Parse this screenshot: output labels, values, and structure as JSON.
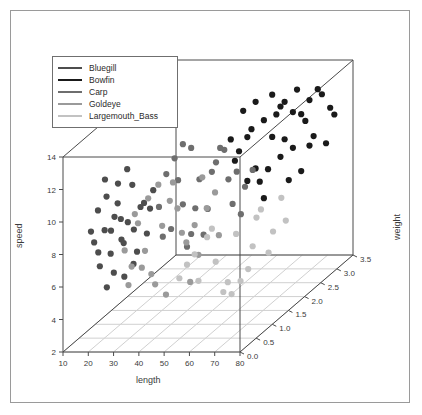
{
  "figure": {
    "background": "#ffffff",
    "border_color": "#9a9a9a"
  },
  "legend": {
    "border_color": "#6f6f6f",
    "entries": [
      {
        "label": "Bluegill",
        "color": "#4d4d4d"
      },
      {
        "label": "Bowfin",
        "color": "#1a1a1a"
      },
      {
        "label": "Carp",
        "color": "#6e6e6e"
      },
      {
        "label": "Goldeye",
        "color": "#9a9a9a"
      },
      {
        "label": "Largemouth_Bass",
        "color": "#c2c2c2"
      }
    ]
  },
  "chart_data": {
    "type": "scatter",
    "projection": "3d",
    "title": "",
    "xlabel": "length",
    "ylabel": "speed",
    "zlabel": "weight",
    "xlim": [
      10,
      80
    ],
    "ylim": [
      2,
      14
    ],
    "zlim": [
      0.0,
      3.5
    ],
    "xticks": [
      10,
      20,
      30,
      40,
      50,
      60,
      70,
      80
    ],
    "yticks": [
      2,
      4,
      6,
      8,
      10,
      12,
      14
    ],
    "zticks": [
      "0.0",
      "0.5",
      "1.0",
      "1.5",
      "2.0",
      "2.5",
      "3.0",
      "3.5"
    ],
    "grid": "floor-only",
    "legend_position": "upper-left",
    "series": [
      {
        "name": "Bluegill",
        "color": "#4d4d4d",
        "points": [
          [
            22,
            8.9,
            0.35
          ],
          [
            25,
            9.6,
            0.42
          ],
          [
            20,
            10.2,
            0.3
          ],
          [
            27,
            8.1,
            0.48
          ],
          [
            24,
            7.4,
            0.38
          ],
          [
            29,
            9.1,
            0.52
          ],
          [
            23,
            11.0,
            0.33
          ],
          [
            31,
            8.6,
            0.55
          ],
          [
            26,
            10.4,
            0.44
          ],
          [
            21,
            6.8,
            0.28
          ],
          [
            33,
            9.9,
            0.6
          ],
          [
            28,
            7.9,
            0.47
          ],
          [
            19,
            8.3,
            0.26
          ],
          [
            30,
            11.3,
            0.58
          ],
          [
            25,
            6.2,
            0.4
          ],
          [
            34,
            10.1,
            0.63
          ],
          [
            22,
            12.0,
            0.36
          ],
          [
            27,
            9.4,
            0.46
          ],
          [
            32,
            7.2,
            0.57
          ],
          [
            24,
            8.8,
            0.39
          ],
          [
            36,
            9.7,
            0.66
          ],
          [
            20,
            7.6,
            0.31
          ],
          [
            29,
            12.4,
            0.5
          ],
          [
            23,
            5.4,
            0.34
          ],
          [
            35,
            8.2,
            0.64
          ],
          [
            26,
            11.6,
            0.45
          ],
          [
            31,
            6.5,
            0.54
          ],
          [
            18,
            9.0,
            0.24
          ],
          [
            37,
            10.8,
            0.68
          ],
          [
            28,
            5.8,
            0.49
          ]
        ]
      },
      {
        "name": "Bowfin",
        "color": "#1a1a1a",
        "points": [
          [
            58,
            11.9,
            1.95
          ],
          [
            62,
            12.6,
            2.15
          ],
          [
            55,
            10.7,
            1.8
          ],
          [
            66,
            13.1,
            2.35
          ],
          [
            60,
            9.8,
            2.05
          ],
          [
            71,
            12.2,
            2.6
          ],
          [
            64,
            11.4,
            2.25
          ],
          [
            57,
            13.6,
            1.9
          ],
          [
            69,
            10.3,
            2.5
          ],
          [
            73,
            12.9,
            2.7
          ],
          [
            61,
            8.9,
            2.1
          ],
          [
            75,
            13.4,
            2.8
          ],
          [
            67,
            11.0,
            2.4
          ],
          [
            59,
            12.3,
            2.0
          ],
          [
            78,
            12.0,
            2.95
          ],
          [
            63,
            9.5,
            2.2
          ],
          [
            70,
            13.8,
            2.55
          ],
          [
            56,
            11.2,
            1.85
          ],
          [
            74,
            10.6,
            2.75
          ],
          [
            65,
            12.7,
            2.3
          ],
          [
            68,
            8.4,
            2.45
          ],
          [
            72,
            11.7,
            2.65
          ],
          [
            54,
            12.1,
            1.75
          ],
          [
            77,
            9.9,
            2.9
          ],
          [
            60,
            13.9,
            2.05
          ],
          [
            66,
            10.0,
            2.35
          ],
          [
            79,
            11.5,
            3.0
          ],
          [
            62,
            7.8,
            2.15
          ],
          [
            76,
            13.0,
            2.85
          ],
          [
            58,
            9.2,
            1.95
          ],
          [
            71,
            8.7,
            2.6
          ],
          [
            64,
            14.0,
            2.25
          ],
          [
            69,
            12.5,
            2.5
          ],
          [
            73,
            10.1,
            2.7
          ],
          [
            67,
            13.3,
            2.4
          ]
        ]
      },
      {
        "name": "Carp",
        "color": "#6e6e6e",
        "points": [
          [
            44,
            9.3,
            1.05
          ],
          [
            48,
            10.5,
            1.25
          ],
          [
            41,
            8.0,
            0.92
          ],
          [
            52,
            11.2,
            1.45
          ],
          [
            46,
            7.3,
            1.15
          ],
          [
            55,
            9.9,
            1.6
          ],
          [
            43,
            10.9,
            0.98
          ],
          [
            50,
            8.5,
            1.35
          ],
          [
            38,
            9.6,
            0.78
          ],
          [
            57,
            10.2,
            1.7
          ],
          [
            45,
            6.6,
            1.1
          ],
          [
            53,
            12.0,
            1.5
          ],
          [
            47,
            8.8,
            1.2
          ],
          [
            40,
            11.5,
            0.85
          ],
          [
            59,
            9.1,
            1.8
          ],
          [
            49,
            7.0,
            1.3
          ],
          [
            42,
            12.3,
            0.95
          ],
          [
            56,
            8.3,
            1.65
          ],
          [
            51,
            10.7,
            1.4
          ],
          [
            39,
            7.7,
            0.82
          ],
          [
            54,
            11.8,
            1.55
          ],
          [
            44,
            13.0,
            1.05
          ],
          [
            58,
            7.5,
            1.75
          ],
          [
            46,
            12.6,
            1.15
          ],
          [
            61,
            10.0,
            1.88
          ]
        ]
      },
      {
        "name": "Goldeye",
        "color": "#9a9a9a",
        "points": [
          [
            34,
            7.1,
            0.66
          ],
          [
            39,
            8.4,
            0.8
          ],
          [
            30,
            6.3,
            0.56
          ],
          [
            43,
            9.2,
            0.96
          ],
          [
            36,
            5.6,
            0.7
          ],
          [
            47,
            7.8,
            1.18
          ],
          [
            32,
            8.9,
            0.6
          ],
          [
            45,
            6.9,
            1.08
          ],
          [
            28,
            7.4,
            0.5
          ],
          [
            50,
            8.6,
            1.32
          ],
          [
            37,
            4.9,
            0.74
          ],
          [
            41,
            9.8,
            0.88
          ],
          [
            33,
            6.1,
            0.64
          ],
          [
            48,
            5.9,
            1.22
          ],
          [
            35,
            10.3,
            0.68
          ],
          [
            44,
            7.6,
            1.02
          ],
          [
            29,
            5.2,
            0.54
          ],
          [
            52,
            9.4,
            1.42
          ],
          [
            38,
            11.0,
            0.76
          ],
          [
            46,
            4.4,
            1.12
          ],
          [
            31,
            9.5,
            0.58
          ],
          [
            49,
            10.6,
            1.26
          ],
          [
            40,
            4.1,
            0.84
          ],
          [
            53,
            6.7,
            1.46
          ],
          [
            42,
            10.9,
            0.9
          ]
        ]
      },
      {
        "name": "Largemouth_Bass",
        "color": "#c2c2c2",
        "points": [
          [
            52,
            5.1,
            1.44
          ],
          [
            57,
            6.4,
            1.68
          ],
          [
            48,
            4.3,
            1.22
          ],
          [
            62,
            7.0,
            1.92
          ],
          [
            55,
            3.6,
            1.58
          ],
          [
            66,
            5.8,
            2.12
          ],
          [
            50,
            6.8,
            1.33
          ],
          [
            60,
            4.0,
            1.82
          ],
          [
            45,
            5.5,
            1.1
          ],
          [
            69,
            6.2,
            2.28
          ],
          [
            54,
            3.1,
            1.52
          ],
          [
            63,
            7.4,
            1.98
          ],
          [
            47,
            6.0,
            1.18
          ],
          [
            58,
            3.4,
            1.74
          ],
          [
            51,
            7.2,
            1.4
          ],
          [
            65,
            4.6,
            2.06
          ],
          [
            43,
            4.8,
            1.02
          ],
          [
            68,
            7.7,
            2.22
          ],
          [
            56,
            2.8,
            1.62
          ],
          [
            61,
            5.3,
            1.88
          ]
        ]
      }
    ]
  }
}
